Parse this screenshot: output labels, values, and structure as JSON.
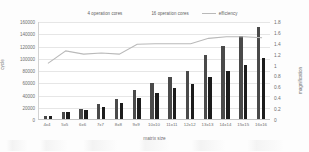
{
  "chart_data": {
    "type": "bar",
    "title": "",
    "xlabel": "matrix size",
    "ylabel": "cycle",
    "ylabel_secondary": "magnification",
    "grid": true,
    "legend_position": "top-center",
    "categories": [
      "4x4",
      "5x5",
      "6x6",
      "7x7",
      "8x8",
      "9x9",
      "10x10",
      "11x11",
      "12x12",
      "13x13",
      "14x14",
      "15x15",
      "16x16"
    ],
    "ylim": [
      0,
      160000
    ],
    "yticks": [
      "0",
      "20000",
      "40000",
      "60000",
      "80000",
      "100000",
      "120000",
      "140000",
      "160000"
    ],
    "ylim_secondary": [
      0,
      1.8
    ],
    "yticks_secondary": [
      "0",
      "0.2",
      "0.4",
      "0.6",
      "0.8",
      "1",
      "1.2",
      "1.4",
      "1.6",
      "1.8"
    ],
    "series": [
      {
        "name": "4 operation cores",
        "type": "bar",
        "axis": "left",
        "color": "#4a4a4a",
        "values": [
          5000,
          12000,
          16000,
          25000,
          32000,
          47000,
          58000,
          68000,
          79000,
          105000,
          120000,
          136000,
          150000
        ]
      },
      {
        "name": "16 operation cores",
        "type": "bar",
        "axis": "left",
        "color": "#1c1c1c",
        "values": [
          5000,
          11000,
          14000,
          20000,
          26000,
          34000,
          42000,
          50000,
          57000,
          69000,
          79000,
          88000,
          100000
        ]
      },
      {
        "name": "efficiency",
        "type": "line",
        "axis": "right",
        "color": "#b9b9b9",
        "values": [
          1.04,
          1.27,
          1.21,
          1.23,
          1.21,
          1.39,
          1.4,
          1.4,
          1.4,
          1.5,
          1.53,
          1.53,
          1.51
        ]
      }
    ]
  },
  "legend": {
    "items": [
      {
        "label": "4 operation cores",
        "marker": "bar",
        "color": "#4a4a4a"
      },
      {
        "label": "16 operation cores",
        "marker": "bar",
        "color": "#1c1c1c"
      },
      {
        "label": "efficiency",
        "marker": "line",
        "color": "#b9b9b9"
      }
    ]
  }
}
